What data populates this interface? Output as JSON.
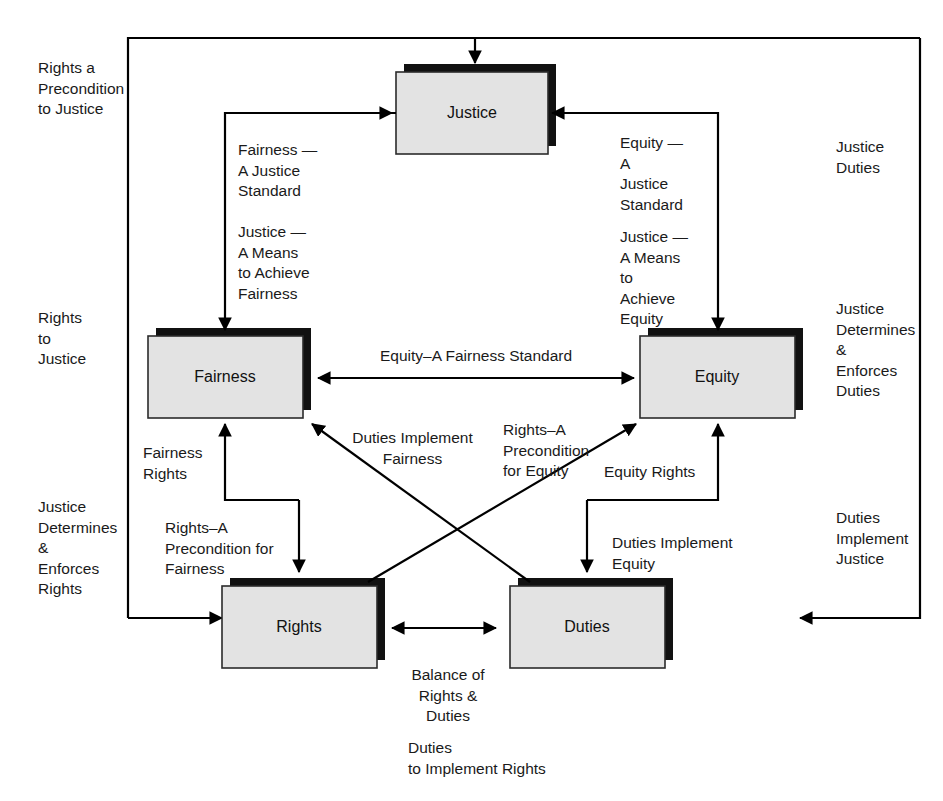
{
  "diagram": {
    "type": "concept-relationship-diagram",
    "nodes": [
      {
        "id": "justice",
        "label": "Justice"
      },
      {
        "id": "fairness",
        "label": "Fairness"
      },
      {
        "id": "equity",
        "label": "Equity"
      },
      {
        "id": "rights",
        "label": "Rights"
      },
      {
        "id": "duties",
        "label": "Duties"
      }
    ],
    "edge_labels": {
      "rights_precondition_justice": "Rights a\nPrecondition\nto Justice",
      "fairness_justice_standard": "Fairness —\nA Justice\nStandard",
      "justice_means_fairness": "Justice —\nA Means\nto Achieve\nFairness",
      "equity_justice_standard": "Equity —\nA\nJustice\nStandard",
      "justice_means_equity": "Justice —\nA Means\nto\nAchieve\nEquity",
      "justice_duties": "Justice\nDuties",
      "rights_to_justice": "Rights\nto\nJustice",
      "justice_determines_enforces_duties": "Justice\nDetermines\n&\nEnforces\nDuties",
      "equity_fairness_standard": "Equity–A Fairness Standard",
      "justice_determines_enforces_rights": "Justice\nDetermines\n&\nEnforces\nRights",
      "duties_implement_justice": "Duties\nImplement\nJustice",
      "fairness_rights": "Fairness\nRights",
      "duties_implement_fairness": "Duties Implement\nFairness",
      "rights_precondition_equity": "Rights–A\nPrecondition\nfor Equity",
      "equity_rights": "Equity Rights",
      "rights_precondition_fairness": "Rights–A\nPrecondition for\nFairness",
      "duties_implement_equity": "Duties Implement\nEquity",
      "balance_rights_duties": "Balance of\nRights &\nDuties",
      "duties_to_implement_rights": "Duties\nto Implement Rights"
    },
    "colors": {
      "box_fill": "#e3e3e3",
      "box_border": "#2b2b2b",
      "box_shadow": "#111111",
      "line": "#000000",
      "text": "#1a1a1a",
      "background": "#ffffff"
    }
  }
}
